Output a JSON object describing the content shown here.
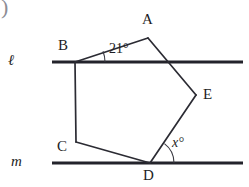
{
  "figure": {
    "type": "geometry-diagram",
    "corner_fragment": ")",
    "background_color": "#ffffff",
    "stroke_color": "#2b2b33",
    "line_color": "#23232b",
    "lines": [
      {
        "name": "l",
        "label": "ℓ",
        "y": 62,
        "x_start": 52,
        "x_end": 243,
        "label_x": 12,
        "label_y": 54
      },
      {
        "name": "m",
        "label": "m",
        "y": 163,
        "x_start": 52,
        "x_end": 243,
        "label_x": 14,
        "label_y": 155
      }
    ],
    "vertices": [
      {
        "name": "A",
        "label": "A",
        "x": 148,
        "y": 38,
        "label_x": 142,
        "label_y": 13
      },
      {
        "name": "B",
        "label": "B",
        "x": 75,
        "y": 62,
        "label_x": 58,
        "label_y": 39
      },
      {
        "name": "C",
        "label": "C",
        "x": 76,
        "y": 142,
        "label_x": 57,
        "label_y": 140
      },
      {
        "name": "D",
        "label": "D",
        "x": 150,
        "y": 163,
        "label_x": 143,
        "label_y": 168
      },
      {
        "name": "E",
        "label": "E",
        "x": 196,
        "y": 95,
        "label_x": 203,
        "label_y": 88
      }
    ],
    "edges": [
      {
        "name": "AB",
        "from": "A",
        "to": "B"
      },
      {
        "name": "BC",
        "from": "B",
        "to": "C"
      },
      {
        "name": "CD",
        "from": "C",
        "to": "D"
      },
      {
        "name": "DE",
        "from": "D",
        "to": "E"
      },
      {
        "name": "EA",
        "from": "E",
        "to": "A"
      }
    ],
    "angles": [
      {
        "name": "angle-at-B",
        "label": "21°",
        "value": 21,
        "at_vertex": "B",
        "between": [
          "line l",
          "BA"
        ],
        "label_x": 109,
        "label_y": 42,
        "arc_cx": 75,
        "arc_cy": 62,
        "arc_r": 30
      },
      {
        "name": "angle-at-D",
        "label": "x°",
        "value": "x",
        "at_vertex": "D",
        "between": [
          "line m",
          "DE"
        ],
        "label_x": 172,
        "label_y": 136,
        "arc_cx": 150,
        "arc_cy": 163,
        "arc_r": 24
      }
    ],
    "intersections": [
      {
        "name": "EA-crosses-line-l",
        "x": 168,
        "y": 62
      }
    ]
  }
}
